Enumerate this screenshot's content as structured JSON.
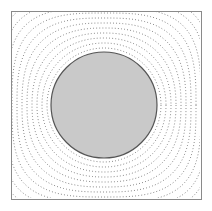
{
  "figure": {
    "kind": "contour-plot",
    "title": "",
    "canvas": {
      "width": 212,
      "height": 211,
      "background": "#ffffff"
    }
  },
  "chart_data": {
    "type": "contour",
    "title": "",
    "subtitle": "",
    "xlabel": "",
    "ylabel": "",
    "grid": false,
    "legend": null,
    "legend_position": "none",
    "axis_visible": false,
    "tick_labels_x": [],
    "tick_labels_y": [],
    "xlim": [
      11,
      201
    ],
    "ylim": [
      11,
      199
    ],
    "domain": {
      "shape": "square",
      "x": 11,
      "y": 11,
      "width": 190,
      "height": 188,
      "stroke": "#8a8a8a",
      "stroke_width": 1,
      "fill": "#ffffff"
    },
    "inclusion": {
      "shape": "circle",
      "cx": 104,
      "cy": 105,
      "r": 53,
      "fill": "#c9c9c9",
      "stroke": "#555555",
      "stroke_width": 1.2,
      "label": ""
    },
    "contours": {
      "style": "dotted",
      "stroke": "#6f6f6f",
      "stroke_width": 0.9,
      "dash_pattern": "0.9 2.2",
      "count": 11,
      "cx": 104,
      "cy": 105,
      "radii": [
        57,
        62,
        67,
        72,
        77,
        82,
        87,
        92,
        97,
        102,
        107
      ],
      "squareness": [
        0.0,
        0.02,
        0.05,
        0.09,
        0.14,
        0.2,
        0.27,
        0.35,
        0.44,
        0.54,
        0.64
      ],
      "levels": [
        1.0,
        0.9,
        0.8,
        0.7,
        0.6,
        0.5,
        0.4,
        0.3,
        0.2,
        0.1,
        0.05
      ]
    }
  }
}
